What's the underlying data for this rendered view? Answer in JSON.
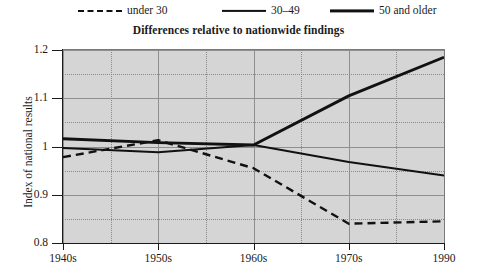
{
  "legend": {
    "items": [
      {
        "label": "under 30",
        "style": "dashed",
        "left": 78,
        "icon": "dashed-line-icon"
      },
      {
        "label": "30–49",
        "style": "solid-thin",
        "left": 222,
        "icon": "solid-line-icon"
      },
      {
        "label": "50 and older",
        "style": "solid-thick",
        "left": 330,
        "icon": "thick-line-icon"
      }
    ]
  },
  "chart_data": {
    "type": "line",
    "title": "Differences relative to nationwide findings",
    "xlabel": "",
    "ylabel": "Index of national results",
    "x": [
      "1940s",
      "1950s",
      "1960s",
      "1970s",
      "1990"
    ],
    "xtick_labels": [
      "1940s",
      "1950s",
      "1960s",
      "1970s",
      "1990"
    ],
    "ytick_labels": [
      "0.8",
      "0.9",
      "1",
      "1.1",
      "1.2"
    ],
    "ytick_values": [
      0.8,
      0.9,
      1.0,
      1.1,
      1.2
    ],
    "ylim": [
      0.8,
      1.2
    ],
    "xlim": [
      0,
      4
    ],
    "grid": true,
    "legend_position": "top",
    "series": [
      {
        "name": "under 30",
        "style": "dashed",
        "values": [
          0.978,
          1.013,
          0.955,
          0.84,
          0.845
        ]
      },
      {
        "name": "30–49",
        "style": "solid-thin",
        "values": [
          0.997,
          0.988,
          1.003,
          0.968,
          0.94
        ]
      },
      {
        "name": "50 and older",
        "style": "solid-thick",
        "values": [
          1.016,
          1.008,
          1.003,
          1.105,
          1.185
        ]
      }
    ],
    "colors": {
      "line": "#111111",
      "plot_background": "#d5d5d5",
      "grid_major": "#8f8f8f",
      "grid_minor": "#8a8a8a",
      "axis": "#1a1a1a"
    }
  }
}
